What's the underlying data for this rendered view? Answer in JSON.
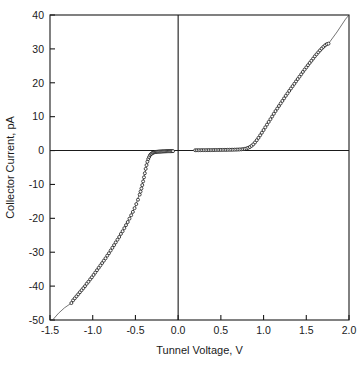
{
  "chart_data": {
    "type": "scatter",
    "title": "",
    "xlabel": "Tunnel Voltage, V",
    "ylabel": "Collector Current, pA",
    "xlim": [
      -1.5,
      2.0
    ],
    "ylim": [
      -50,
      40
    ],
    "xticks": [
      -1.5,
      -1.0,
      -0.5,
      0.0,
      0.5,
      1.0,
      1.5,
      2.0
    ],
    "xticklabels": [
      "-1.5",
      "-1.0",
      "-0.5",
      "0.0",
      "0.5",
      "1.0",
      "1.5",
      "2.0"
    ],
    "yticks": [
      -50,
      -40,
      -30,
      -20,
      -10,
      0,
      10,
      20,
      30,
      40
    ],
    "yticklabels": [
      "-50",
      "-40",
      "-30",
      "-20",
      "-10",
      "0",
      "10",
      "20",
      "30",
      "40"
    ],
    "grid": false,
    "legend": null,
    "marker": "open-circle",
    "marker_size": 3,
    "series": [
      {
        "name": "Collector current vs tunnel voltage",
        "marker": "open-circle",
        "points": [
          [
            -1.25,
            -45.0
          ],
          [
            -1.23,
            -44.2
          ],
          [
            -1.21,
            -43.6
          ],
          [
            -1.19,
            -43.0
          ],
          [
            -1.17,
            -42.4
          ],
          [
            -1.15,
            -41.8
          ],
          [
            -1.13,
            -41.2
          ],
          [
            -1.11,
            -40.6
          ],
          [
            -1.09,
            -40.0
          ],
          [
            -1.07,
            -39.3
          ],
          [
            -1.05,
            -38.7
          ],
          [
            -1.03,
            -38.0
          ],
          [
            -1.01,
            -37.4
          ],
          [
            -0.99,
            -36.7
          ],
          [
            -0.97,
            -36.0
          ],
          [
            -0.95,
            -35.3
          ],
          [
            -0.93,
            -34.6
          ],
          [
            -0.91,
            -33.9
          ],
          [
            -0.89,
            -33.2
          ],
          [
            -0.87,
            -32.5
          ],
          [
            -0.85,
            -31.8
          ],
          [
            -0.83,
            -31.0
          ],
          [
            -0.81,
            -30.3
          ],
          [
            -0.79,
            -29.5
          ],
          [
            -0.77,
            -28.7
          ],
          [
            -0.75,
            -27.9
          ],
          [
            -0.73,
            -27.1
          ],
          [
            -0.71,
            -26.3
          ],
          [
            -0.69,
            -25.5
          ],
          [
            -0.67,
            -24.6
          ],
          [
            -0.65,
            -23.8
          ],
          [
            -0.63,
            -22.9
          ],
          [
            -0.61,
            -22.0
          ],
          [
            -0.59,
            -21.1
          ],
          [
            -0.57,
            -20.1
          ],
          [
            -0.55,
            -19.1
          ],
          [
            -0.53,
            -18.1
          ],
          [
            -0.51,
            -17.0
          ],
          [
            -0.49,
            -15.8
          ],
          [
            -0.47,
            -14.5
          ],
          [
            -0.45,
            -13.0
          ],
          [
            -0.44,
            -12.1
          ],
          [
            -0.43,
            -11.2
          ],
          [
            -0.42,
            -10.2
          ],
          [
            -0.41,
            -9.1
          ],
          [
            -0.4,
            -7.9
          ],
          [
            -0.39,
            -6.7
          ],
          [
            -0.38,
            -5.4
          ],
          [
            -0.37,
            -4.3
          ],
          [
            -0.36,
            -3.3
          ],
          [
            -0.35,
            -2.5
          ],
          [
            -0.34,
            -1.9
          ],
          [
            -0.33,
            -1.4
          ],
          [
            -0.32,
            -1.1
          ],
          [
            -0.31,
            -0.9
          ],
          [
            -0.3,
            -0.7
          ],
          [
            -0.29,
            -0.6
          ],
          [
            -0.28,
            -0.5
          ],
          [
            -0.27,
            -0.45
          ],
          [
            -0.26,
            -0.4
          ],
          [
            -0.25,
            -0.38
          ],
          [
            -0.24,
            -0.35
          ],
          [
            -0.23,
            -0.33
          ],
          [
            -0.22,
            -0.3
          ],
          [
            -0.21,
            -0.3
          ],
          [
            -0.2,
            -0.28
          ],
          [
            -0.19,
            -0.26
          ],
          [
            -0.18,
            -0.25
          ],
          [
            -0.17,
            -0.24
          ],
          [
            -0.16,
            -0.23
          ],
          [
            -0.15,
            -0.22
          ],
          [
            -0.14,
            -0.21
          ],
          [
            -0.13,
            -0.2
          ],
          [
            -0.12,
            -0.2
          ],
          [
            -0.11,
            -0.19
          ],
          [
            -0.1,
            -0.18
          ],
          [
            -0.09,
            -0.18
          ],
          [
            -0.08,
            -0.17
          ],
          [
            -0.07,
            -0.16
          ],
          [
            -0.06,
            -0.16
          ],
          [
            0.2,
            0.1
          ],
          [
            0.22,
            0.1
          ],
          [
            0.24,
            0.11
          ],
          [
            0.26,
            0.11
          ],
          [
            0.28,
            0.12
          ],
          [
            0.3,
            0.12
          ],
          [
            0.32,
            0.13
          ],
          [
            0.34,
            0.13
          ],
          [
            0.36,
            0.14
          ],
          [
            0.38,
            0.14
          ],
          [
            0.4,
            0.15
          ],
          [
            0.42,
            0.15
          ],
          [
            0.44,
            0.16
          ],
          [
            0.46,
            0.16
          ],
          [
            0.48,
            0.17
          ],
          [
            0.5,
            0.18
          ],
          [
            0.52,
            0.18
          ],
          [
            0.54,
            0.19
          ],
          [
            0.56,
            0.2
          ],
          [
            0.58,
            0.21
          ],
          [
            0.6,
            0.22
          ],
          [
            0.62,
            0.23
          ],
          [
            0.64,
            0.24
          ],
          [
            0.66,
            0.26
          ],
          [
            0.68,
            0.28
          ],
          [
            0.7,
            0.3
          ],
          [
            0.72,
            0.33
          ],
          [
            0.74,
            0.37
          ],
          [
            0.76,
            0.42
          ],
          [
            0.78,
            0.5
          ],
          [
            0.8,
            0.62
          ],
          [
            0.82,
            0.8
          ],
          [
            0.84,
            1.05
          ],
          [
            0.86,
            1.4
          ],
          [
            0.88,
            1.85
          ],
          [
            0.9,
            2.4
          ],
          [
            0.92,
            3.05
          ],
          [
            0.94,
            3.75
          ],
          [
            0.96,
            4.5
          ],
          [
            0.98,
            5.25
          ],
          [
            1.0,
            6.05
          ],
          [
            1.02,
            6.85
          ],
          [
            1.04,
            7.65
          ],
          [
            1.06,
            8.45
          ],
          [
            1.08,
            9.25
          ],
          [
            1.1,
            10.05
          ],
          [
            1.12,
            10.85
          ],
          [
            1.14,
            11.65
          ],
          [
            1.16,
            12.4
          ],
          [
            1.18,
            13.15
          ],
          [
            1.2,
            13.9
          ],
          [
            1.22,
            14.65
          ],
          [
            1.24,
            15.4
          ],
          [
            1.26,
            16.15
          ],
          [
            1.28,
            16.85
          ],
          [
            1.3,
            17.6
          ],
          [
            1.32,
            18.3
          ],
          [
            1.34,
            19.0
          ],
          [
            1.36,
            19.7
          ],
          [
            1.38,
            20.4
          ],
          [
            1.4,
            21.1
          ],
          [
            1.42,
            21.8
          ],
          [
            1.44,
            22.5
          ],
          [
            1.46,
            23.2
          ],
          [
            1.48,
            23.9
          ],
          [
            1.5,
            24.55
          ],
          [
            1.52,
            25.2
          ],
          [
            1.54,
            25.85
          ],
          [
            1.56,
            26.5
          ],
          [
            1.58,
            27.15
          ],
          [
            1.6,
            27.8
          ],
          [
            1.62,
            28.4
          ],
          [
            1.64,
            29.0
          ],
          [
            1.66,
            29.55
          ],
          [
            1.68,
            30.1
          ],
          [
            1.7,
            30.6
          ],
          [
            1.72,
            31.05
          ],
          [
            1.74,
            31.4
          ],
          [
            1.76,
            31.55
          ]
        ]
      },
      {
        "name": "fit-line",
        "style": "solid-thin",
        "points": [
          [
            -1.47,
            -50.0
          ],
          [
            -1.4,
            -48.0
          ],
          [
            -1.33,
            -46.4
          ],
          [
            -1.25,
            -45.0
          ],
          [
            -1.1,
            -40.4
          ],
          [
            -0.95,
            -35.3
          ],
          [
            -0.8,
            -29.9
          ],
          [
            -0.65,
            -23.8
          ],
          [
            -0.5,
            -16.4
          ],
          [
            -0.42,
            -10.2
          ],
          [
            -0.36,
            -3.3
          ],
          [
            -0.3,
            -0.7
          ],
          [
            -0.2,
            -0.28
          ],
          [
            -0.1,
            -0.18
          ],
          [
            -0.06,
            -0.16
          ]
        ]
      },
      {
        "name": "fit-line-positive",
        "style": "solid-thin",
        "points": [
          [
            0.2,
            0.1
          ],
          [
            0.5,
            0.18
          ],
          [
            0.8,
            0.62
          ],
          [
            0.9,
            2.4
          ],
          [
            1.1,
            10.05
          ],
          [
            1.4,
            21.1
          ],
          [
            1.6,
            27.8
          ],
          [
            1.76,
            31.55
          ],
          [
            1.86,
            35.0
          ],
          [
            1.96,
            38.8
          ],
          [
            2.0,
            40.0
          ]
        ]
      }
    ]
  },
  "axes": {
    "vertical_zero_line_at": 0.0,
    "horizontal_zero_line_at": 0
  }
}
